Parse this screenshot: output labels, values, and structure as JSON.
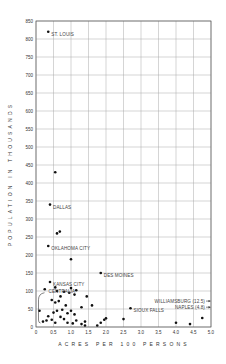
{
  "chart_data": {
    "type": "scatter",
    "title": "",
    "xlabel": "ACRES PER 100 PERSONS",
    "ylabel": "POPULATION IN THOUSANDS",
    "xlim": [
      0,
      5.0
    ],
    "ylim": [
      0,
      850
    ],
    "grid": true,
    "legend": null,
    "x_ticks": [
      "0",
      "0.5",
      "1.0",
      "1.5",
      "2.0",
      "2.5",
      "3.0",
      "3.5",
      "4.0",
      "4.5",
      "5.0"
    ],
    "y_ticks": [
      "0",
      "50",
      "100",
      "150",
      "200",
      "250",
      "300",
      "350",
      "400",
      "450",
      "500",
      "550",
      "600",
      "650",
      "700",
      "750",
      "800",
      "850"
    ],
    "labeled_points": [
      {
        "label": "ST. LOUIS",
        "x": 0.35,
        "y": 820
      },
      {
        "label": "DALLAS",
        "x": 0.4,
        "y": 340
      },
      {
        "label": "OKLAHOMA CITY",
        "x": 0.35,
        "y": 225
      },
      {
        "label": "KANSAS CITY",
        "x": 0.4,
        "y": 125
      },
      {
        "label": "DES MOINES",
        "x": 1.85,
        "y": 150
      },
      {
        "label": "SIOUX FALLS",
        "x": 2.7,
        "y": 52
      },
      {
        "label": "WILLIAMSBURG (12.5)",
        "x": 5.0,
        "y": 72,
        "off_scale": true
      },
      {
        "label": "NAPLES (4.8)",
        "x": 5.0,
        "y": 55,
        "off_scale": true
      }
    ],
    "annotations": [
      {
        "text": "CENTRALIA",
        "x": 0.3,
        "y": 98,
        "type": "bracket"
      }
    ],
    "points": [
      [
        0.35,
        820
      ],
      [
        0.55,
        430
      ],
      [
        0.4,
        340
      ],
      [
        0.6,
        260
      ],
      [
        0.68,
        265
      ],
      [
        0.35,
        225
      ],
      [
        1.0,
        188
      ],
      [
        0.4,
        125
      ],
      [
        1.85,
        150
      ],
      [
        0.55,
        110
      ],
      [
        0.6,
        100
      ],
      [
        0.8,
        98
      ],
      [
        0.95,
        95
      ],
      [
        1.1,
        90
      ],
      [
        0.7,
        85
      ],
      [
        1.0,
        108
      ],
      [
        1.15,
        102
      ],
      [
        0.45,
        75
      ],
      [
        0.55,
        68
      ],
      [
        0.65,
        72
      ],
      [
        0.85,
        60
      ],
      [
        1.3,
        55
      ],
      [
        0.75,
        48
      ],
      [
        0.5,
        40
      ],
      [
        0.6,
        45
      ],
      [
        0.9,
        38
      ],
      [
        1.0,
        45
      ],
      [
        1.1,
        35
      ],
      [
        0.7,
        28
      ],
      [
        0.8,
        22
      ],
      [
        1.15,
        18
      ],
      [
        1.4,
        15
      ],
      [
        0.2,
        15
      ],
      [
        0.3,
        18
      ],
      [
        0.45,
        20
      ],
      [
        0.55,
        12
      ],
      [
        0.9,
        12
      ],
      [
        1.05,
        10
      ],
      [
        1.3,
        8
      ],
      [
        1.4,
        4
      ],
      [
        1.75,
        4
      ],
      [
        1.85,
        12
      ],
      [
        1.95,
        20
      ],
      [
        2.0,
        24
      ],
      [
        2.5,
        22
      ],
      [
        2.7,
        52
      ],
      [
        4.0,
        12
      ],
      [
        4.4,
        8
      ],
      [
        4.75,
        25
      ],
      [
        0.1,
        45
      ],
      [
        0.35,
        30
      ],
      [
        1.6,
        60
      ],
      [
        1.45,
        85
      ],
      [
        0.25,
        105
      ]
    ]
  },
  "axes": {
    "xlabel": "ACRES PER 100 PERSONS",
    "ylabel": "POPULATION IN THOUSANDS"
  }
}
